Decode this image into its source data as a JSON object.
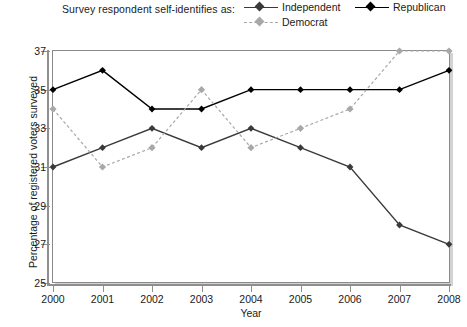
{
  "legend": {
    "caption": "Survey respondent self-identifies as:",
    "entries": [
      {
        "label": "Independent",
        "color": "#3a3a3a",
        "style": "solid",
        "marker": "diamond"
      },
      {
        "label": "Republican",
        "color": "#000000",
        "style": "solid",
        "marker": "diamond"
      },
      {
        "label": "Democrat",
        "color": "#a8a8a8",
        "style": "dashed",
        "marker": "diamond"
      }
    ]
  },
  "axes": {
    "x_title": "Year",
    "y_title": "Percentage of registered voters surveyed",
    "y_ticks": [
      "25",
      "27",
      "29",
      "31",
      "33",
      "35",
      "37"
    ],
    "x_ticks": [
      "2000",
      "2001",
      "2002",
      "2003",
      "2004",
      "2005",
      "2006",
      "2007",
      "2008"
    ]
  },
  "chart_data": {
    "type": "line",
    "title": "",
    "subtitle": "",
    "xlabel": "Year",
    "ylabel": "Percentage of registered voters surveyed",
    "categories": [
      "2000",
      "2001",
      "2002",
      "2003",
      "2004",
      "2005",
      "2006",
      "2007",
      "2008"
    ],
    "x": [
      2000,
      2001,
      2002,
      2003,
      2004,
      2005,
      2006,
      2007,
      2008
    ],
    "xlim": [
      2000,
      2008
    ],
    "ylim": [
      25,
      37
    ],
    "y_tick_values": [
      25,
      27,
      29,
      31,
      33,
      35,
      37
    ],
    "grid": false,
    "legend_position": "top",
    "series": [
      {
        "name": "Independent",
        "color": "#3a3a3a",
        "line_style": "solid",
        "marker": "diamond",
        "values": [
          31,
          32,
          33,
          32,
          33,
          32,
          31,
          28,
          27
        ]
      },
      {
        "name": "Republican",
        "color": "#000000",
        "line_style": "solid",
        "marker": "diamond",
        "values": [
          35,
          36,
          34,
          34,
          35,
          35,
          35,
          35,
          36
        ]
      },
      {
        "name": "Democrat",
        "color": "#a8a8a8",
        "line_style": "dashed",
        "marker": "diamond",
        "values": [
          34,
          31,
          32,
          35,
          32,
          33,
          34,
          37,
          37
        ]
      }
    ]
  }
}
